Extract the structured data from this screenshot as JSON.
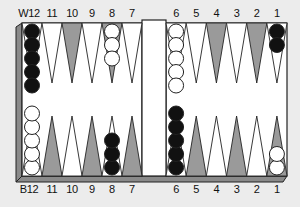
{
  "diagram": {
    "colors": {
      "background": "#ececec",
      "board": "#ffffff",
      "frame": "#8a8a8a",
      "frame_dark": "#555555",
      "dark_point": "#9a9a9a",
      "light_point": "#ffffff",
      "black_checker": "#111111",
      "white_checker": "#ffffff",
      "outline": "#222222"
    },
    "top_labels": [
      "W12",
      "11",
      "10",
      "9",
      "8",
      "7",
      "6",
      "5",
      "4",
      "3",
      "2",
      "1"
    ],
    "bottom_labels": [
      "B12",
      "11",
      "10",
      "9",
      "8",
      "7",
      "6",
      "5",
      "4",
      "3",
      "2",
      "1"
    ],
    "top_row": [
      {
        "label": "W12",
        "shade": "light",
        "checkers": 5,
        "checker_color": "black"
      },
      {
        "label": "11",
        "shade": "light",
        "checkers": 0,
        "checker_color": null
      },
      {
        "label": "10",
        "shade": "dark",
        "checkers": 0,
        "checker_color": null
      },
      {
        "label": "9",
        "shade": "light",
        "checkers": 0,
        "checker_color": null
      },
      {
        "label": "8",
        "shade": "dark",
        "checkers": 3,
        "checker_color": "white"
      },
      {
        "label": "7",
        "shade": "light",
        "checkers": 0,
        "checker_color": null
      },
      {
        "label": "6",
        "shade": "light",
        "checkers": 5,
        "checker_color": "white"
      },
      {
        "label": "5",
        "shade": "light",
        "checkers": 0,
        "checker_color": null
      },
      {
        "label": "4",
        "shade": "dark",
        "checkers": 0,
        "checker_color": null
      },
      {
        "label": "3",
        "shade": "light",
        "checkers": 0,
        "checker_color": null
      },
      {
        "label": "2",
        "shade": "dark",
        "checkers": 0,
        "checker_color": null
      },
      {
        "label": "1",
        "shade": "light",
        "checkers": 2,
        "checker_color": "black"
      }
    ],
    "bottom_row": [
      {
        "label": "B12",
        "shade": "light",
        "checkers": 5,
        "checker_color": "white"
      },
      {
        "label": "11",
        "shade": "dark",
        "checkers": 0,
        "checker_color": null
      },
      {
        "label": "10",
        "shade": "light",
        "checkers": 0,
        "checker_color": null
      },
      {
        "label": "9",
        "shade": "dark",
        "checkers": 0,
        "checker_color": null
      },
      {
        "label": "8",
        "shade": "light",
        "checkers": 3,
        "checker_color": "black"
      },
      {
        "label": "7",
        "shade": "dark",
        "checkers": 0,
        "checker_color": null
      },
      {
        "label": "6",
        "shade": "light",
        "checkers": 5,
        "checker_color": "black"
      },
      {
        "label": "5",
        "shade": "dark",
        "checkers": 0,
        "checker_color": null
      },
      {
        "label": "4",
        "shade": "light",
        "checkers": 0,
        "checker_color": null
      },
      {
        "label": "3",
        "shade": "dark",
        "checkers": 0,
        "checker_color": null
      },
      {
        "label": "2",
        "shade": "light",
        "checkers": 0,
        "checker_color": null
      },
      {
        "label": "1",
        "shade": "dark",
        "checkers": 2,
        "checker_color": "white"
      }
    ]
  }
}
